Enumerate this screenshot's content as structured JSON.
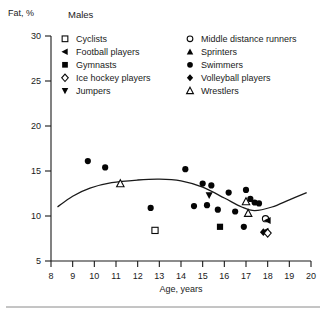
{
  "chart_data": {
    "type": "scatter",
    "title": "Males",
    "xlabel": "Age, years",
    "ylabel": "Fat, %",
    "xlim": [
      8,
      20
    ],
    "ylim": [
      5,
      30
    ],
    "xticks": [
      8,
      9,
      10,
      11,
      12,
      13,
      14,
      15,
      16,
      17,
      18,
      19,
      20
    ],
    "yticks": [
      5,
      10,
      15,
      20,
      25,
      30
    ],
    "grid": false,
    "legend_position": "top",
    "legend": [
      {
        "label": "Cyclists",
        "marker": "open-square"
      },
      {
        "label": "Football players",
        "marker": "filled-left-triangle"
      },
      {
        "label": "Gymnasts",
        "marker": "filled-square"
      },
      {
        "label": "Ice hockey players",
        "marker": "open-diamond"
      },
      {
        "label": "Jumpers",
        "marker": "filled-down-triangle"
      },
      {
        "label": "Middle distance runners",
        "marker": "open-circle"
      },
      {
        "label": "Sprinters",
        "marker": "filled-up-triangle"
      },
      {
        "label": "Swimmers",
        "marker": "filled-circle"
      },
      {
        "label": "Volleyball players",
        "marker": "filled-diamond"
      },
      {
        "label": "Wrestlers",
        "marker": "open-triangle"
      }
    ],
    "series": [
      {
        "name": "Swimmers",
        "marker": "filled-circle",
        "points": [
          [
            9.7,
            16.1
          ],
          [
            10.5,
            15.4
          ],
          [
            12.6,
            10.9
          ],
          [
            14.2,
            15.2
          ],
          [
            15.0,
            13.6
          ],
          [
            15.4,
            13.4
          ],
          [
            15.2,
            11.2
          ],
          [
            15.7,
            10.7
          ],
          [
            16.2,
            12.6
          ],
          [
            16.5,
            10.5
          ],
          [
            17.0,
            12.9
          ],
          [
            17.2,
            11.9
          ],
          [
            17.4,
            11.5
          ],
          [
            17.6,
            11.4
          ],
          [
            16.9,
            8.8
          ],
          [
            14.6,
            11.1
          ]
        ]
      },
      {
        "name": "Wrestlers",
        "marker": "open-triangle",
        "points": [
          [
            11.2,
            13.6
          ],
          [
            17.0,
            11.6
          ],
          [
            17.1,
            10.3
          ]
        ]
      },
      {
        "name": "Cyclists",
        "marker": "open-square",
        "points": [
          [
            12.8,
            8.4
          ]
        ]
      },
      {
        "name": "Gymnasts",
        "marker": "filled-square",
        "points": [
          [
            15.8,
            8.8
          ]
        ]
      },
      {
        "name": "Jumpers",
        "marker": "filled-down-triangle",
        "points": [
          [
            15.3,
            12.3
          ]
        ]
      },
      {
        "name": "Middle distance runners",
        "marker": "open-circle",
        "points": [
          [
            17.9,
            9.7
          ]
        ]
      },
      {
        "name": "Football players",
        "marker": "filled-left-triangle",
        "points": [
          [
            18.0,
            9.5
          ],
          [
            17.9,
            8.3
          ]
        ]
      },
      {
        "name": "Volleyball players",
        "marker": "filled-diamond",
        "points": [
          [
            17.8,
            8.2
          ]
        ]
      },
      {
        "name": "Ice hockey players",
        "marker": "open-diamond",
        "points": [
          [
            18.0,
            8.1
          ]
        ]
      }
    ],
    "trend_line": {
      "description": "smoothed fitted curve of fat percentage versus age",
      "points": [
        [
          8.3,
          11.0
        ],
        [
          9.0,
          12.2
        ],
        [
          9.8,
          13.1
        ],
        [
          10.8,
          13.7
        ],
        [
          12.0,
          14.0
        ],
        [
          13.0,
          14.1
        ],
        [
          14.0,
          13.9
        ],
        [
          15.0,
          13.2
        ],
        [
          16.0,
          12.0
        ],
        [
          16.8,
          11.0
        ],
        [
          17.4,
          10.6
        ],
        [
          18.2,
          11.0
        ],
        [
          19.0,
          11.8
        ],
        [
          19.8,
          12.6
        ]
      ]
    }
  }
}
